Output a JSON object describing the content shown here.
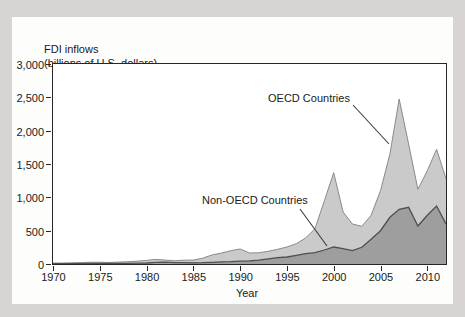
{
  "figure": {
    "title_line1": "FDI inflows",
    "title_line2": "(billions of U.S. dollars)",
    "xlabel": "Year"
  },
  "colors": {
    "background": "#d7d4d2",
    "panel": "#fdfdfc",
    "axis": "#262626",
    "oecd_fill": "#cacaca",
    "oecd_edge": "#8a8a8a",
    "non_oecd_fill": "#9e9e9e",
    "non_oecd_edge": "#4f4f4f",
    "leader_line": "#3a3a3a"
  },
  "chart_data": {
    "type": "area",
    "stacked": true,
    "title": "FDI inflows (billions of U.S. dollars)",
    "xlabel": "Year",
    "ylabel": "FDI inflows (billions of U.S. dollars)",
    "xlim": [
      1970,
      2012
    ],
    "ylim": [
      0,
      3000
    ],
    "grid": false,
    "x_ticks": [
      1970,
      1975,
      1980,
      1985,
      1990,
      1995,
      2000,
      2005,
      2010
    ],
    "x_tick_labels": [
      "1970",
      "1975",
      "1980",
      "1985",
      "1990",
      "1995",
      "2000",
      "2005",
      "2010"
    ],
    "y_ticks": [
      0,
      500,
      1000,
      1500,
      2000,
      2500,
      3000
    ],
    "y_tick_labels": [
      "0",
      "500",
      "1,000",
      "1,500",
      "2,000",
      "2,500",
      "3,000"
    ],
    "years": [
      1970,
      1971,
      1972,
      1973,
      1974,
      1975,
      1976,
      1977,
      1978,
      1979,
      1980,
      1981,
      1982,
      1983,
      1984,
      1985,
      1986,
      1987,
      1988,
      1989,
      1990,
      1991,
      1992,
      1993,
      1994,
      1995,
      1996,
      1997,
      1998,
      1999,
      2000,
      2001,
      2002,
      2003,
      2004,
      2005,
      2006,
      2007,
      2008,
      2009,
      2010,
      2011,
      2012
    ],
    "series": [
      {
        "name": "Non-OECD Countries",
        "values": [
          4,
          4,
          5,
          6,
          7,
          10,
          8,
          9,
          11,
          13,
          15,
          25,
          28,
          20,
          20,
          18,
          20,
          25,
          33,
          35,
          42,
          48,
          58,
          78,
          95,
          105,
          130,
          155,
          170,
          210,
          255,
          230,
          200,
          250,
          370,
          500,
          700,
          820,
          850,
          570,
          730,
          870,
          600
        ]
      },
      {
        "name": "OECD Countries",
        "values": [
          9,
          11,
          13,
          16,
          19,
          17,
          15,
          19,
          23,
          29,
          39,
          44,
          30,
          30,
          37,
          40,
          67,
          112,
          131,
          165,
          183,
          117,
          110,
          112,
          125,
          150,
          175,
          235,
          360,
          740,
          1115,
          550,
          400,
          315,
          360,
          600,
          950,
          1655,
          950,
          550,
          670,
          850,
          680
        ]
      }
    ],
    "stack_totals": [
      13,
      15,
      18,
      22,
      26,
      27,
      23,
      28,
      34,
      42,
      54,
      69,
      58,
      50,
      57,
      58,
      87,
      137,
      164,
      200,
      225,
      165,
      168,
      190,
      220,
      255,
      305,
      390,
      530,
      950,
      1370,
      780,
      600,
      565,
      730,
      1100,
      1650,
      2475,
      1800,
      1120,
      1400,
      1720,
      1280
    ],
    "annotations": [
      {
        "label": "OECD Countries"
      },
      {
        "label": "Non-OECD Countries"
      }
    ]
  }
}
